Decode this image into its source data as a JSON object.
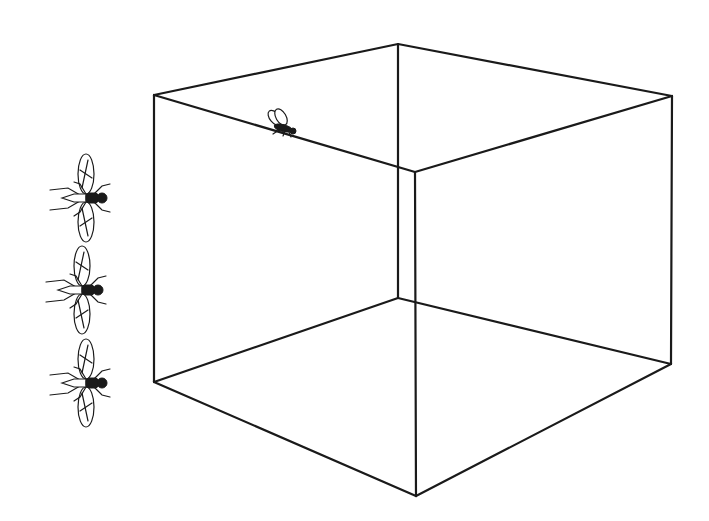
{
  "figure": {
    "stroke_color": "#1a1a1a",
    "background_color": "#ffffff",
    "cube": {
      "vertices": {
        "top_left": [
          154,
          95
        ],
        "top_back": [
          398,
          44
        ],
        "top_right": [
          672,
          96
        ],
        "top_front": [
          415,
          172
        ],
        "bottom_left": [
          154,
          382
        ],
        "bottom_back": [
          398,
          298
        ],
        "bottom_right": [
          671,
          364
        ],
        "bottom_front": [
          416,
          496
        ]
      }
    },
    "flies": [
      {
        "id": "fly-1",
        "position": [
          80,
          198
        ],
        "orientation": "wings-spread-top-view"
      },
      {
        "id": "fly-2",
        "position": [
          76,
          290
        ],
        "orientation": "wings-spread-top-view"
      },
      {
        "id": "fly-3",
        "position": [
          82,
          383
        ],
        "orientation": "wings-spread-top-view"
      },
      {
        "id": "fly-on-cube",
        "position": [
          283,
          126
        ],
        "orientation": "side-view-on-edge"
      }
    ]
  }
}
